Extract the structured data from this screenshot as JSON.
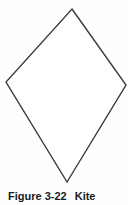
{
  "figure": {
    "caption_label": "Figure 3-22",
    "caption_title": "Kite",
    "shape_name": "kite",
    "stroke_color": "#3a3a3a",
    "fill_color": "#ffffff",
    "background_color": "#fefefe",
    "text_color": "#1b1b1b",
    "stroke_width": 1.4,
    "vertices": [
      {
        "name": "top",
        "x": 72,
        "y": 9
      },
      {
        "name": "right",
        "x": 126,
        "y": 85
      },
      {
        "name": "bottom",
        "x": 67,
        "y": 182
      },
      {
        "name": "left",
        "x": 6,
        "y": 82
      }
    ],
    "points_path": "72,9 126,85 67,182 6,82"
  }
}
